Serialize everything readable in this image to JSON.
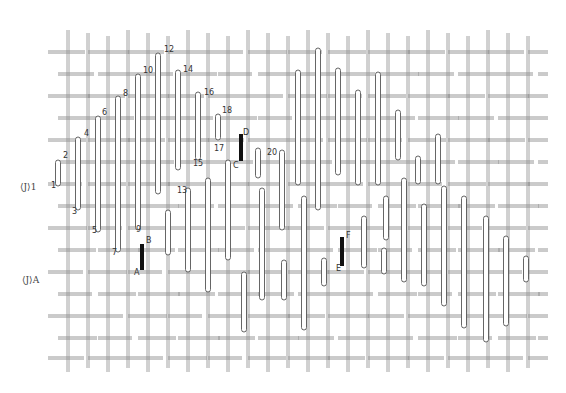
{
  "diagram": {
    "type": "woven-lattice-sketch",
    "colors": {
      "line": "#8a8a8a",
      "tube_fill": "#ffffff",
      "tube_stroke": "#555555",
      "highlight": "#111111"
    },
    "grid": {
      "rows_y": [
        52,
        74,
        96,
        118,
        140,
        162,
        184,
        206,
        228,
        250,
        272,
        294,
        316,
        338,
        358
      ],
      "cols_x": [
        68,
        88,
        108,
        128,
        148,
        168,
        188,
        208,
        228,
        248,
        268,
        288,
        308,
        328,
        348,
        368,
        388,
        408,
        428,
        448,
        468,
        488,
        508,
        528
      ],
      "x_start": 48,
      "x_end": 548,
      "y_start": 30,
      "y_end": 372
    },
    "side_labels": [
      {
        "text": "⟨J⟩1",
        "x": 20,
        "y": 190
      },
      {
        "text": "⟨J⟩A",
        "x": 22,
        "y": 283
      }
    ],
    "numbered_labels": [
      {
        "text": "1",
        "x": 51,
        "y": 188
      },
      {
        "text": "2",
        "x": 63,
        "y": 158
      },
      {
        "text": "3",
        "x": 72,
        "y": 214
      },
      {
        "text": "4",
        "x": 84,
        "y": 136
      },
      {
        "text": "5",
        "x": 92,
        "y": 233
      },
      {
        "text": "6",
        "x": 102,
        "y": 115
      },
      {
        "text": "7",
        "x": 112,
        "y": 255
      },
      {
        "text": "8",
        "x": 123,
        "y": 96
      },
      {
        "text": "9",
        "x": 136,
        "y": 232
      },
      {
        "text": "10",
        "x": 143,
        "y": 73
      },
      {
        "text": "13",
        "x": 177,
        "y": 193
      },
      {
        "text": "12",
        "x": 164,
        "y": 52
      },
      {
        "text": "14",
        "x": 183,
        "y": 72
      },
      {
        "text": "15",
        "x": 193,
        "y": 166
      },
      {
        "text": "16",
        "x": 204,
        "y": 95
      },
      {
        "text": "17",
        "x": 214,
        "y": 151
      },
      {
        "text": "18",
        "x": 222,
        "y": 113
      },
      {
        "text": "20",
        "x": 267,
        "y": 155
      }
    ],
    "letter_labels": [
      {
        "text": "A",
        "x": 134,
        "y": 275
      },
      {
        "text": "B",
        "x": 146,
        "y": 243
      },
      {
        "text": "C",
        "x": 233,
        "y": 168
      },
      {
        "text": "D",
        "x": 243,
        "y": 135
      },
      {
        "text": "E",
        "x": 336,
        "y": 271
      },
      {
        "text": "F",
        "x": 346,
        "y": 238
      }
    ],
    "highlighted_segments": [
      {
        "name": "A-B",
        "x": 142,
        "y1": 244,
        "y2": 270
      },
      {
        "name": "C-D",
        "x": 241,
        "y1": 134,
        "y2": 161
      },
      {
        "name": "E-F",
        "x": 342,
        "y1": 237,
        "y2": 266
      }
    ],
    "tubes": [
      {
        "x": 58,
        "y1": 160,
        "y2": 186
      },
      {
        "x": 78,
        "y1": 137,
        "y2": 210
      },
      {
        "x": 98,
        "y1": 116,
        "y2": 232
      },
      {
        "x": 118,
        "y1": 96,
        "y2": 252
      },
      {
        "x": 138,
        "y1": 74,
        "y2": 230
      },
      {
        "x": 158,
        "y1": 53,
        "y2": 194
      },
      {
        "x": 178,
        "y1": 70,
        "y2": 170
      },
      {
        "x": 198,
        "y1": 92,
        "y2": 160
      },
      {
        "x": 218,
        "y1": 114,
        "y2": 140
      },
      {
        "x": 168,
        "y1": 210,
        "y2": 255
      },
      {
        "x": 188,
        "y1": 188,
        "y2": 272
      },
      {
        "x": 208,
        "y1": 178,
        "y2": 292
      },
      {
        "x": 228,
        "y1": 160,
        "y2": 260
      },
      {
        "x": 258,
        "y1": 148,
        "y2": 178
      },
      {
        "x": 262,
        "y1": 188,
        "y2": 300
      },
      {
        "x": 282,
        "y1": 150,
        "y2": 230
      },
      {
        "x": 298,
        "y1": 70,
        "y2": 185
      },
      {
        "x": 318,
        "y1": 48,
        "y2": 210
      },
      {
        "x": 338,
        "y1": 68,
        "y2": 175
      },
      {
        "x": 358,
        "y1": 90,
        "y2": 185
      },
      {
        "x": 378,
        "y1": 72,
        "y2": 185
      },
      {
        "x": 398,
        "y1": 110,
        "y2": 160
      },
      {
        "x": 404,
        "y1": 178,
        "y2": 282
      },
      {
        "x": 304,
        "y1": 196,
        "y2": 330
      },
      {
        "x": 324,
        "y1": 258,
        "y2": 286
      },
      {
        "x": 244,
        "y1": 272,
        "y2": 332
      },
      {
        "x": 284,
        "y1": 260,
        "y2": 300
      },
      {
        "x": 364,
        "y1": 216,
        "y2": 268
      },
      {
        "x": 384,
        "y1": 248,
        "y2": 274
      },
      {
        "x": 386,
        "y1": 196,
        "y2": 240
      },
      {
        "x": 424,
        "y1": 204,
        "y2": 286
      },
      {
        "x": 444,
        "y1": 186,
        "y2": 306
      },
      {
        "x": 464,
        "y1": 196,
        "y2": 328
      },
      {
        "x": 486,
        "y1": 216,
        "y2": 342
      },
      {
        "x": 506,
        "y1": 236,
        "y2": 326
      },
      {
        "x": 526,
        "y1": 256,
        "y2": 282
      },
      {
        "x": 418,
        "y1": 156,
        "y2": 184
      },
      {
        "x": 438,
        "y1": 134,
        "y2": 184
      }
    ]
  }
}
